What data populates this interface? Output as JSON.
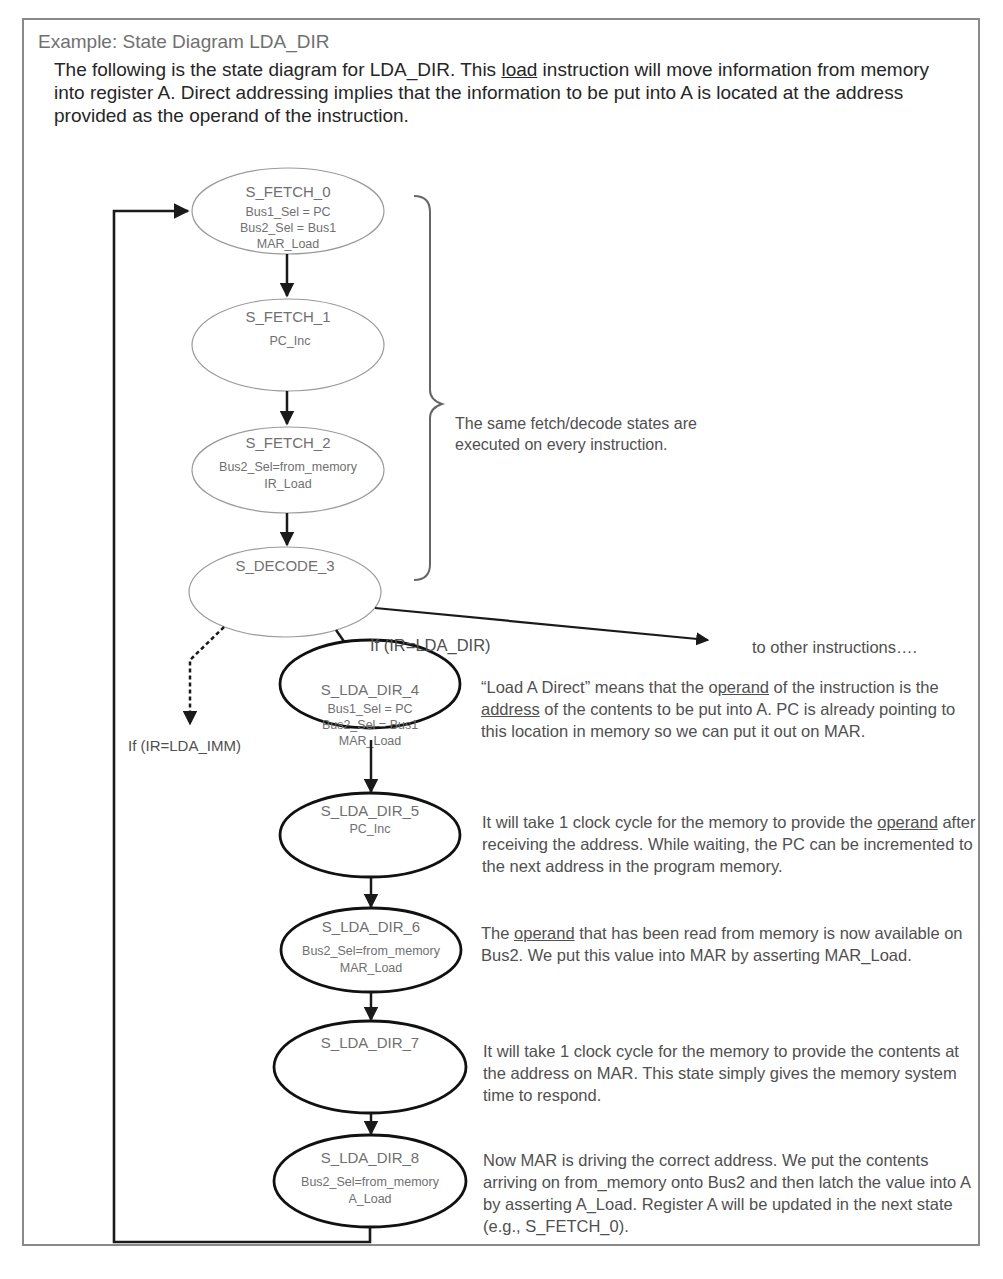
{
  "document": {
    "title": "Example: State Diagram LDA_DIR",
    "intro": {
      "part1": "The following is the state diagram for LDA_DIR.  This ",
      "underlined": "load",
      "part2": " instruction will move information from memory into register A.  Direct addressing implies that the information to be put into A is located at the address provided as the operand of the instruction."
    }
  },
  "diagram": {
    "fetch_states": [
      {
        "name": "S_FETCH_0",
        "actions": [
          "Bus1_Sel = PC",
          "Bus2_Sel = Bus1",
          "MAR_Load"
        ]
      },
      {
        "name": "S_FETCH_1",
        "actions": [
          "PC_Inc"
        ]
      },
      {
        "name": "S_FETCH_2",
        "actions": [
          "Bus2_Sel=from_memory",
          "IR_Load"
        ]
      },
      {
        "name": "S_DECODE_3",
        "actions": []
      }
    ],
    "lda_states": [
      {
        "name": "S_LDA_DIR_4",
        "actions": [
          "Bus1_Sel = PC",
          "Bus2_Sel = Bus1",
          "MAR_Load"
        ]
      },
      {
        "name": "S_LDA_DIR_5",
        "actions": [
          "PC_Inc"
        ]
      },
      {
        "name": "S_LDA_DIR_6",
        "actions": [
          "Bus2_Sel=from_memory",
          "MAR_Load"
        ]
      },
      {
        "name": "S_LDA_DIR_7",
        "actions": []
      },
      {
        "name": "S_LDA_DIR_8",
        "actions": [
          "Bus2_Sel=from_memory",
          "A_Load"
        ]
      }
    ],
    "transitions": {
      "lda_dir": "If (IR=LDA_DIR)",
      "lda_imm": "If (IR=LDA_IMM)",
      "other": "to other instructions…."
    },
    "brace_note": "The same fetch/decode states are executed on every instruction.",
    "annotations": {
      "s4": {
        "t1": "“Load A Direct” means that the o",
        "u1": "perand",
        "t2": " of the instruction is the ",
        "u2": "address",
        "t3": " of the contents to be put into A.  PC is already pointing to this location in memory so we can put it out on MAR."
      },
      "s5": {
        "t1": "It will take 1 clock cycle for the memory to provide the ",
        "u1": "operand",
        "t2": " after receiving the address. While waiting, the PC can be incremented to the next address in the program memory."
      },
      "s6": {
        "t1": "The ",
        "u1": "operand",
        "t2": " that has been read from memory is now available on Bus2.  We put this value into MAR by asserting MAR_Load."
      },
      "s7": "It will take 1 clock cycle for the memory to provide the contents at the address on MAR.  This state simply gives the memory system time to respond.",
      "s8": "Now MAR is driving the correct address.  We put the contents arriving on from_memory onto Bus2 and then latch the value into A by asserting A_Load. Register A will be updated in the next state (e.g., S_FETCH_0)."
    }
  }
}
